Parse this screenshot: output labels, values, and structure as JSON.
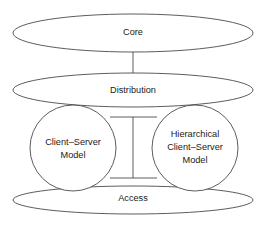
{
  "diagram": {
    "type": "network-hierarchy-diagram",
    "stroke_color": "#4a4a4a",
    "text_color": "#1a1a1a",
    "background_color": "#ffffff",
    "layers": [
      {
        "id": "core",
        "label": "Core",
        "shape": "ellipse"
      },
      {
        "id": "distribution",
        "label": "Distribution",
        "shape": "ellipse"
      },
      {
        "id": "access",
        "label": "Access",
        "shape": "ellipse"
      }
    ],
    "models": [
      {
        "id": "client-server-model",
        "shape": "circle",
        "lines": [
          "Client–Server",
          "Model"
        ]
      },
      {
        "id": "hierarchical-client-server-model",
        "shape": "circle",
        "lines": [
          "Hierarchical",
          "Client–Server",
          "Model"
        ]
      }
    ]
  }
}
